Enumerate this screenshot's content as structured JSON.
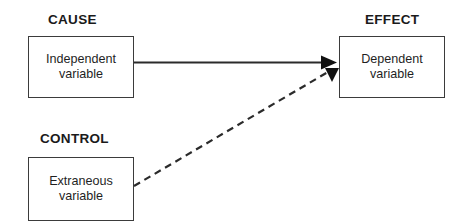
{
  "diagram": {
    "title_visible": false,
    "background_color": "#ffffff",
    "line_color": "#2b2b2b",
    "box_border_color": "#3b3b3b",
    "text_color": "#1f1f1f",
    "sections": [
      {
        "id": "cause",
        "label": "CAUSE"
      },
      {
        "id": "effect",
        "label": "EFFECT"
      },
      {
        "id": "control",
        "label": "CONTROL"
      }
    ],
    "nodes": [
      {
        "id": "independent",
        "section": "cause",
        "text": "Independent\nvariable",
        "line1": "Independent",
        "line2": "variable"
      },
      {
        "id": "dependent",
        "section": "effect",
        "text": "Dependent\nvariable",
        "line1": "Dependent",
        "line2": "variable"
      },
      {
        "id": "extraneous",
        "section": "control",
        "text": "Extraneous\nvariable",
        "line1": "Extraneous",
        "line2": "variable"
      }
    ],
    "edges": [
      {
        "id": "independent-to-dependent",
        "from": "independent",
        "to": "dependent",
        "style": "solid",
        "arrowhead": "filled-triangle-right"
      },
      {
        "id": "extraneous-to-dependent",
        "from": "extraneous",
        "to": "dependent",
        "style": "dashed",
        "arrowhead": "filled-triangle-down"
      }
    ]
  }
}
